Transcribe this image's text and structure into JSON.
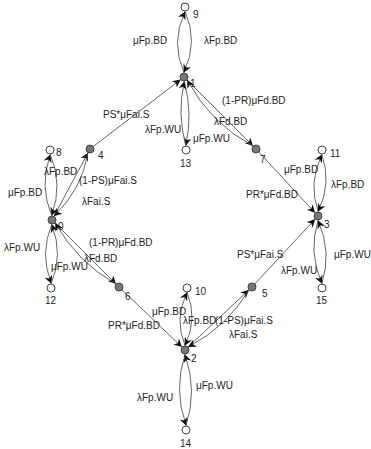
{
  "diagram": {
    "type": "state-transition-graph",
    "nodes": [
      {
        "id": "0",
        "x": 52,
        "y": 220,
        "style": "filled",
        "label_dx": 6,
        "label_dy": 10
      },
      {
        "id": "1",
        "x": 184,
        "y": 77,
        "style": "filled",
        "label_dx": 6,
        "label_dy": 10
      },
      {
        "id": "2",
        "x": 185,
        "y": 350,
        "style": "filled",
        "label_dx": 6,
        "label_dy": 12
      },
      {
        "id": "3",
        "x": 318,
        "y": 216,
        "style": "filled",
        "label_dx": 6,
        "label_dy": 12
      },
      {
        "id": "4",
        "x": 90,
        "y": 149,
        "style": "filled",
        "label_dx": 8,
        "label_dy": 10
      },
      {
        "id": "5",
        "x": 252,
        "y": 287,
        "style": "filled",
        "label_dx": 10,
        "label_dy": 10
      },
      {
        "id": "6",
        "x": 119,
        "y": 287,
        "style": "filled",
        "label_dx": 6,
        "label_dy": 13
      },
      {
        "id": "7",
        "x": 256,
        "y": 149,
        "style": "filled",
        "label_dx": 4,
        "label_dy": 14
      },
      {
        "id": "8",
        "x": 50,
        "y": 150,
        "style": "open",
        "label_dx": 6,
        "label_dy": 6
      },
      {
        "id": "9",
        "x": 185,
        "y": 7,
        "style": "open",
        "label_dx": 8,
        "label_dy": 11
      },
      {
        "id": "10",
        "x": 187,
        "y": 288,
        "style": "open",
        "label_dx": 8,
        "label_dy": 7
      },
      {
        "id": "11",
        "x": 322,
        "y": 150,
        "style": "open",
        "label_dx": 8,
        "label_dy": 7
      },
      {
        "id": "12",
        "x": 51,
        "y": 288,
        "style": "open",
        "label_dx": -6,
        "label_dy": 16
      },
      {
        "id": "13",
        "x": 186,
        "y": 150,
        "style": "open",
        "label_dx": -6,
        "label_dy": 17
      },
      {
        "id": "14",
        "x": 186,
        "y": 430,
        "style": "open",
        "label_dx": -6,
        "label_dy": 17
      },
      {
        "id": "15",
        "x": 322,
        "y": 288,
        "style": "open",
        "label_dx": -6,
        "label_dy": 16
      }
    ],
    "edges": [
      {
        "from": "1",
        "to": "9",
        "label": "λFp.BD",
        "bend": -14,
        "lx": 204,
        "ly": 44
      },
      {
        "from": "9",
        "to": "1",
        "label": "μFp.BD",
        "bend": -14,
        "lx": 133,
        "ly": 44
      },
      {
        "from": "1",
        "to": "13",
        "label": "λFp.WU",
        "bend": -8,
        "lx": 145,
        "ly": 133
      },
      {
        "from": "13",
        "to": "1",
        "label": "μFp.WU",
        "bend": -8,
        "lx": 193,
        "ly": 142
      },
      {
        "from": "4",
        "to": "1",
        "label": "PS*μFai.S",
        "bend": 0,
        "lx": 103,
        "ly": 118
      },
      {
        "from": "1",
        "to": "7",
        "label": "λFd.BD",
        "bend": 0,
        "lx": 214,
        "ly": 125
      },
      {
        "from": "7",
        "to": "1",
        "label": "(1-PR)μFd.BD",
        "bend": -14,
        "lx": 222,
        "ly": 104
      },
      {
        "from": "0",
        "to": "8",
        "label": "λFp.BD",
        "bend": -12,
        "lx": 44,
        "ly": 175
      },
      {
        "from": "8",
        "to": "0",
        "label": "μFp.BD",
        "bend": -12,
        "lx": 8,
        "ly": 196
      },
      {
        "from": "0",
        "to": "4",
        "label": "λFai.S",
        "bend": 0,
        "lx": 82,
        "ly": 205
      },
      {
        "from": "4",
        "to": "0",
        "label": "(1-PS)μFai.S",
        "bend": -12,
        "lx": 79,
        "ly": 184
      },
      {
        "from": "0",
        "to": "12",
        "label": "λFp.WU",
        "bend": 12,
        "lx": 4,
        "ly": 251
      },
      {
        "from": "12",
        "to": "0",
        "label": "μFp.WU",
        "bend": 12,
        "lx": 51,
        "ly": 270
      },
      {
        "from": "0",
        "to": "6",
        "label": "λFd.BD",
        "bend": 0,
        "lx": 84,
        "ly": 262
      },
      {
        "from": "6",
        "to": "0",
        "label": "(1-PR)μFd.BD",
        "bend": -12,
        "lx": 89,
        "ly": 246
      },
      {
        "from": "7",
        "to": "3",
        "label": "PR*μFd.BD",
        "bend": 0,
        "lx": 246,
        "ly": 198
      },
      {
        "from": "3",
        "to": "11",
        "label": "λFp.BD",
        "bend": -12,
        "lx": 331,
        "ly": 188
      },
      {
        "from": "11",
        "to": "3",
        "label": "μFp.BD",
        "bend": -12,
        "lx": 284,
        "ly": 173
      },
      {
        "from": "5",
        "to": "3",
        "label": "PS*μFai.S",
        "bend": 0,
        "lx": 237,
        "ly": 258
      },
      {
        "from": "3",
        "to": "15",
        "label": "λFp.WU",
        "bend": 12,
        "lx": 281,
        "ly": 274
      },
      {
        "from": "15",
        "to": "3",
        "label": "μFp.WU",
        "bend": 12,
        "lx": 334,
        "ly": 258
      },
      {
        "from": "6",
        "to": "2",
        "label": "PR*μFd.BD",
        "bend": 0,
        "lx": 108,
        "ly": 329
      },
      {
        "from": "2",
        "to": "10",
        "label": "λFp.BD",
        "bend": -12,
        "lx": 183,
        "ly": 324
      },
      {
        "from": "10",
        "to": "2",
        "label": "μFp.BD",
        "bend": -12,
        "lx": 152,
        "ly": 315
      },
      {
        "from": "2",
        "to": "5",
        "label": "λFai.S",
        "bend": 0,
        "lx": 229,
        "ly": 338
      },
      {
        "from": "5",
        "to": "2",
        "label": "(1-PS)μFai.S",
        "bend": -12,
        "lx": 215,
        "ly": 324
      },
      {
        "from": "2",
        "to": "14",
        "label": "λFp.WU",
        "bend": 12,
        "lx": 137,
        "ly": 401
      },
      {
        "from": "14",
        "to": "2",
        "label": "μFp.WU",
        "bend": 12,
        "lx": 196,
        "ly": 389
      }
    ],
    "colors": {
      "edge": "#555555",
      "text": "#222222",
      "node_fill": "#777777",
      "node_open": "#ffffff"
    }
  }
}
